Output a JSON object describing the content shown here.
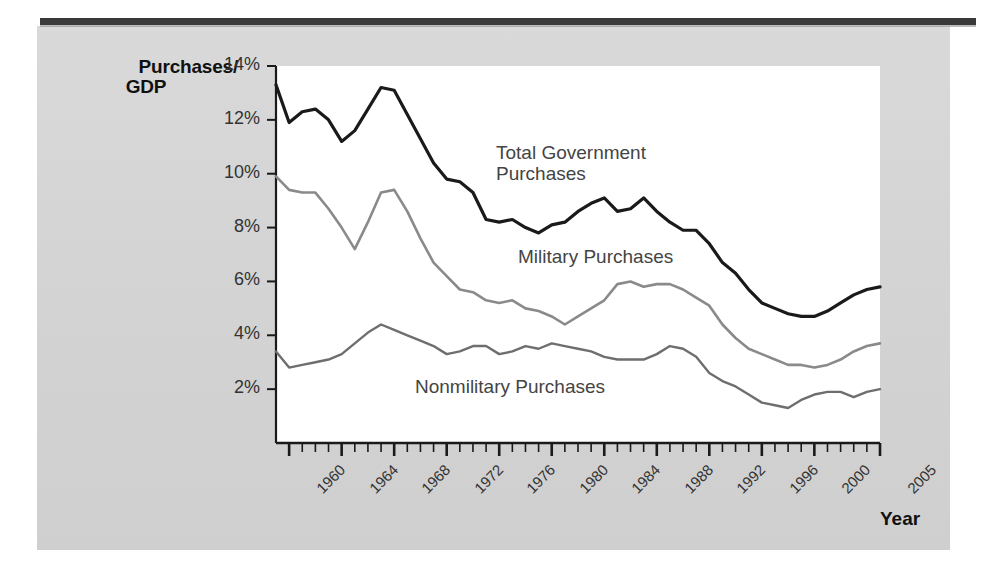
{
  "figure": {
    "y_axis_title_line1": "Purchases/",
    "y_axis_title_line2": "GDP",
    "x_axis_title": "Year",
    "background_color": "#d6d6d6",
    "plot_color": "#ffffff"
  },
  "chart_data": {
    "type": "line",
    "title": "",
    "xlabel": "Year",
    "ylabel": "Purchases/GDP",
    "xlim": [
      1959,
      2005
    ],
    "ylim": [
      0,
      14
    ],
    "ytick_labels": [
      "14%",
      "12%",
      "10%",
      "8%",
      "6%",
      "4%",
      "2%"
    ],
    "ytick_values": [
      14,
      12,
      10,
      8,
      6,
      4,
      2
    ],
    "xtick_labels": [
      "1960",
      "1964",
      "1968",
      "1972",
      "1976",
      "1980",
      "1984",
      "1988",
      "1992",
      "1996",
      "2000",
      "2005"
    ],
    "xtick_values": [
      1960,
      1964,
      1968,
      1972,
      1976,
      1980,
      1984,
      1988,
      1992,
      1996,
      2000,
      2005
    ],
    "grid": false,
    "legend_position": "inline-annotations",
    "x": [
      1959,
      1960,
      1961,
      1962,
      1963,
      1964,
      1965,
      1966,
      1967,
      1968,
      1969,
      1970,
      1971,
      1972,
      1973,
      1974,
      1975,
      1976,
      1977,
      1978,
      1979,
      1980,
      1981,
      1982,
      1983,
      1984,
      1985,
      1986,
      1987,
      1988,
      1989,
      1990,
      1991,
      1992,
      1993,
      1994,
      1995,
      1996,
      1997,
      1998,
      1999,
      2000,
      2001,
      2002,
      2003,
      2004,
      2005
    ],
    "series": [
      {
        "name": "Total Government Purchases",
        "color": "#1a1a1a",
        "width": 3.2,
        "values": [
          13.3,
          11.9,
          12.3,
          12.4,
          12.0,
          11.2,
          11.6,
          12.4,
          13.2,
          13.1,
          12.2,
          11.3,
          10.4,
          9.8,
          9.7,
          9.3,
          8.3,
          8.2,
          8.3,
          8.0,
          7.8,
          8.1,
          8.2,
          8.6,
          8.9,
          9.1,
          8.6,
          8.7,
          9.1,
          8.6,
          8.2,
          7.9,
          7.9,
          7.4,
          6.7,
          6.3,
          5.7,
          5.2,
          5.0,
          4.8,
          4.7,
          4.7,
          4.9,
          5.2,
          5.5,
          5.7,
          5.8
        ]
      },
      {
        "name": "Military Purchases",
        "color": "#8a8a8a",
        "width": 2.6,
        "values": [
          9.9,
          9.4,
          9.3,
          9.3,
          8.7,
          8.0,
          7.2,
          8.2,
          9.3,
          9.4,
          8.6,
          7.6,
          6.7,
          6.2,
          5.7,
          5.6,
          5.3,
          5.2,
          5.3,
          5.0,
          4.9,
          4.7,
          4.4,
          4.7,
          5.0,
          5.3,
          5.9,
          6.0,
          5.8,
          5.9,
          5.9,
          5.7,
          5.4,
          5.1,
          4.4,
          3.9,
          3.5,
          3.3,
          3.1,
          2.9,
          2.9,
          2.8,
          2.9,
          3.1,
          3.4,
          3.6,
          3.7
        ]
      },
      {
        "name": "Nonmilitary Purchases",
        "color": "#6e6e6e",
        "width": 2.4,
        "values": [
          3.4,
          2.8,
          2.9,
          3.0,
          3.1,
          3.3,
          3.7,
          4.1,
          4.4,
          4.2,
          4.0,
          3.8,
          3.6,
          3.3,
          3.4,
          3.6,
          3.6,
          3.3,
          3.4,
          3.6,
          3.5,
          3.7,
          3.6,
          3.5,
          3.4,
          3.2,
          3.1,
          3.1,
          3.1,
          3.3,
          3.6,
          3.5,
          3.2,
          2.6,
          2.3,
          2.1,
          1.8,
          1.5,
          1.4,
          1.3,
          1.6,
          1.8,
          1.9,
          1.9,
          1.7,
          1.9,
          2.0
        ]
      }
    ],
    "annotations": [
      {
        "text": "Total Government\nPurchases",
        "x_px": 496,
        "y_px": 142
      },
      {
        "text": "Military Purchases",
        "x_px": 518,
        "y_px": 246
      },
      {
        "text": "Nonmilitary Purchases",
        "x_px": 415,
        "y_px": 376
      }
    ]
  }
}
